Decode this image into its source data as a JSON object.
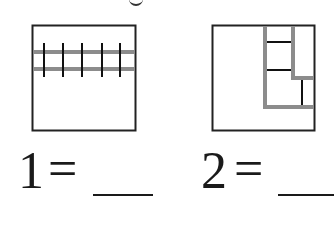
{
  "figure": {
    "top_fragment": "g",
    "colors": {
      "outline": "#222222",
      "highlight": "#8c8c8c",
      "background": "#ffffff"
    },
    "figures": [
      {
        "id": 1,
        "label": "1",
        "equals": "=",
        "blank": "__",
        "description": "square with two gray horizontal bands crossed by five vertical tick marks"
      },
      {
        "id": 2,
        "label": "2",
        "equals": "=",
        "blank": "__",
        "description": "square with gray nested L-shaped strips and three black partition lines"
      }
    ]
  }
}
